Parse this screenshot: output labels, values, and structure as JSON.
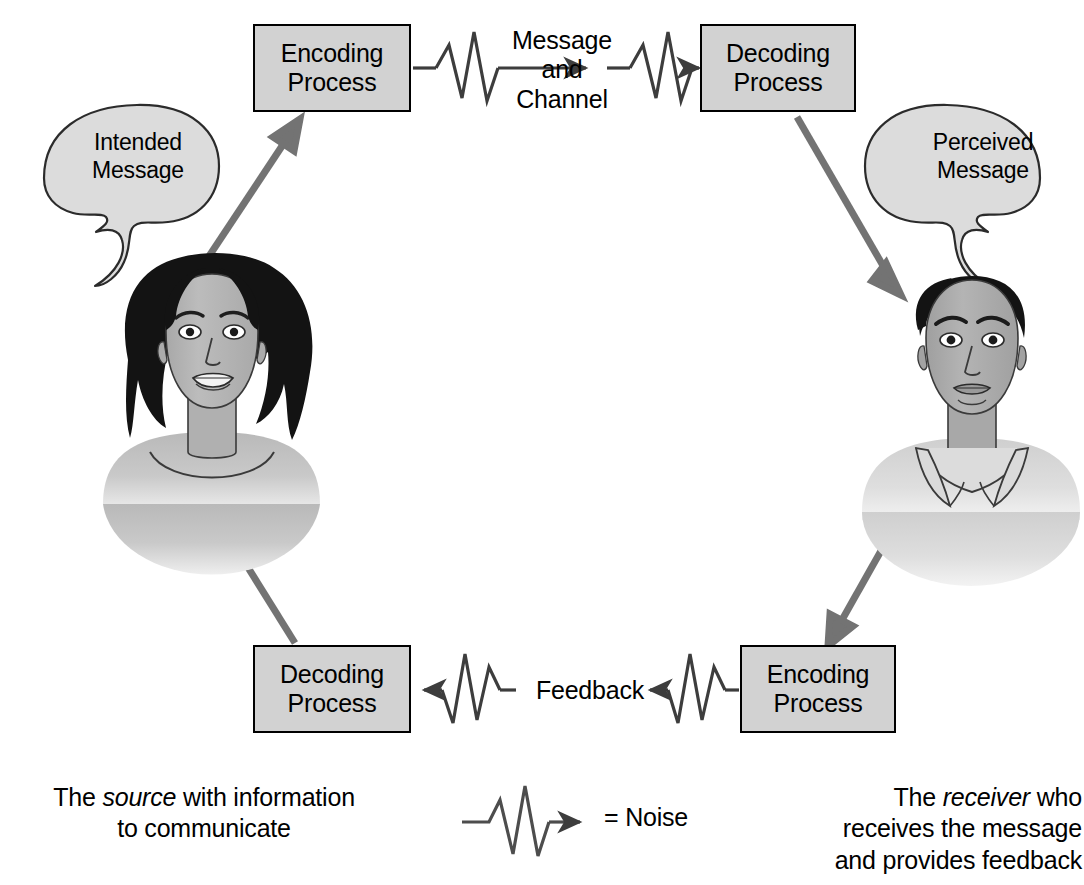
{
  "diagram": {
    "background_color": "#ffffff",
    "box_fill_color": "#d2d2d2",
    "box_border_color": "#000000",
    "arrow_color": "#737373",
    "noise_line_color": "#4d4d4d",
    "boxes": [
      {
        "id": "encoding-top",
        "label_line1": "Encoding",
        "label_line2": "Process"
      },
      {
        "id": "decoding-top",
        "label_line1": "Decoding",
        "label_line2": "Process"
      },
      {
        "id": "decoding-bottom",
        "label_line1": "Decoding",
        "label_line2": "Process"
      },
      {
        "id": "encoding-bottom",
        "label_line1": "Encoding",
        "label_line2": "Process"
      }
    ],
    "flow_labels": {
      "message_line1": "Message",
      "message_line2": "and",
      "message_line3": "Channel",
      "feedback": "Feedback"
    },
    "bubbles": [
      {
        "id": "intended",
        "line1": "Intended",
        "line2": "Message"
      },
      {
        "id": "perceived",
        "line1": "Perceived",
        "line2": "Message"
      }
    ],
    "legend": {
      "equals_noise": "= Noise"
    },
    "captions": {
      "source_prefix": "The ",
      "source_emphasis": "source",
      "source_suffix": " with information",
      "source_line2": "to communicate",
      "receiver_prefix": "The ",
      "receiver_emphasis": "receiver",
      "receiver_suffix": " who",
      "receiver_line2": "receives the message",
      "receiver_line3": "and provides feedback"
    },
    "figures": [
      {
        "id": "source-person",
        "description": "woman with dark shoulder-length hair"
      },
      {
        "id": "receiver-person",
        "description": "man with short dark hair and collared shirt"
      }
    ]
  }
}
